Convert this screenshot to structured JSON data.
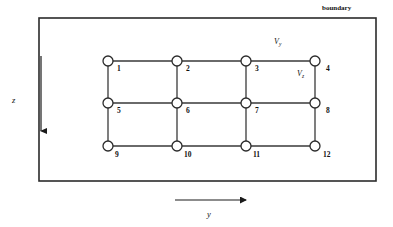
{
  "figure": {
    "type": "mesh-grid-diagram",
    "background_color": "#ffffff",
    "line_color": "#3a3a3a",
    "boundary": {
      "label": "boundary",
      "x": 39,
      "y": 18,
      "width": 337,
      "height": 163,
      "stroke_color": "#2b2b2b",
      "stroke_width": 1.6
    },
    "nodes": [
      {
        "id": "1",
        "label": "1",
        "x": 108,
        "y": 61,
        "label_x": 117,
        "label_y": 72
      },
      {
        "id": "2",
        "label": "2",
        "x": 177,
        "y": 61,
        "label_x": 186,
        "label_y": 72
      },
      {
        "id": "3",
        "label": "3",
        "x": 246,
        "y": 61,
        "label_x": 255,
        "label_y": 72
      },
      {
        "id": "4",
        "label": "4",
        "x": 315,
        "y": 61,
        "label_x": 326,
        "label_y": 72
      },
      {
        "id": "5",
        "label": "5",
        "x": 108,
        "y": 103,
        "label_x": 117,
        "label_y": 114
      },
      {
        "id": "6",
        "label": "6",
        "x": 177,
        "y": 103,
        "label_x": 186,
        "label_y": 114
      },
      {
        "id": "7",
        "label": "7",
        "x": 246,
        "y": 103,
        "label_x": 255,
        "label_y": 114
      },
      {
        "id": "8",
        "label": "8",
        "x": 315,
        "y": 103,
        "label_x": 326,
        "label_y": 114
      },
      {
        "id": "9",
        "label": "9",
        "x": 108,
        "y": 146,
        "label_x": 115,
        "label_y": 158
      },
      {
        "id": "10",
        "label": "10",
        "x": 177,
        "y": 146,
        "label_x": 184,
        "label_y": 158
      },
      {
        "id": "11",
        "label": "11",
        "x": 246,
        "y": 146,
        "label_x": 253,
        "label_y": 158
      },
      {
        "id": "12",
        "label": "12",
        "x": 315,
        "y": 146,
        "label_x": 323,
        "label_y": 158
      }
    ],
    "node_radius": 5,
    "edges": [
      {
        "from": "1",
        "to": "2"
      },
      {
        "from": "2",
        "to": "3"
      },
      {
        "from": "3",
        "to": "4"
      },
      {
        "from": "5",
        "to": "6"
      },
      {
        "from": "6",
        "to": "7"
      },
      {
        "from": "7",
        "to": "8"
      },
      {
        "from": "9",
        "to": "10"
      },
      {
        "from": "10",
        "to": "11"
      },
      {
        "from": "11",
        "to": "12"
      },
      {
        "from": "1",
        "to": "5"
      },
      {
        "from": "2",
        "to": "6"
      },
      {
        "from": "3",
        "to": "7"
      },
      {
        "from": "4",
        "to": "8"
      },
      {
        "from": "5",
        "to": "9"
      },
      {
        "from": "6",
        "to": "10"
      },
      {
        "from": "7",
        "to": "11"
      },
      {
        "from": "8",
        "to": "12"
      }
    ],
    "spacing_labels": [
      {
        "name": "v-y",
        "symbol": "V",
        "subscript": "y",
        "x": 274,
        "y": 44,
        "describes": "horizontal grid spacing between node 3 and node 4"
      },
      {
        "name": "v-z",
        "symbol": "V",
        "subscript": "z",
        "x": 297,
        "y": 76,
        "describes": "vertical grid spacing between node 4 and node 8"
      }
    ],
    "axes": [
      {
        "name": "z-axis",
        "label": "z",
        "direction": "down",
        "arrow_x": 41,
        "arrow_y1": 56,
        "arrow_y2": 138,
        "label_x": 12,
        "label_y": 101
      },
      {
        "name": "y-axis",
        "label": "y",
        "direction": "right",
        "arrow_y": 200,
        "arrow_x1": 175,
        "arrow_x2": 253,
        "label_x": 209,
        "label_y": 217
      }
    ]
  }
}
